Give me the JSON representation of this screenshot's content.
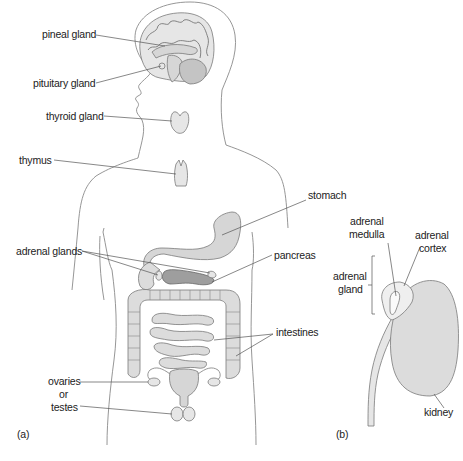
{
  "figure": {
    "panel_a": {
      "caption": "(a)",
      "labels": {
        "pineal": "pineal gland",
        "pituitary": "pituitary gland",
        "thyroid": "thyroid gland",
        "thymus": "thymus",
        "stomach": "stomach",
        "adrenal_glands": "adrenal glands",
        "pancreas": "pancreas",
        "intestines": "intestines",
        "ovaries_line1": "ovaries",
        "ovaries_line2": "or",
        "ovaries_line3": "testes"
      }
    },
    "panel_b": {
      "caption": "(b)",
      "labels": {
        "medulla_line1": "adrenal",
        "medulla_line2": "medulla",
        "cortex_line1": "adrenal",
        "cortex_line2": "cortex",
        "gland_line1": "adrenal",
        "gland_line2": "gland",
        "kidney": "kidney"
      }
    },
    "colors": {
      "organ_fill": "#d6d6d6",
      "pancreas_fill": "#9e9e9e",
      "outline": "#8a8a8a",
      "background": "#ffffff"
    }
  }
}
